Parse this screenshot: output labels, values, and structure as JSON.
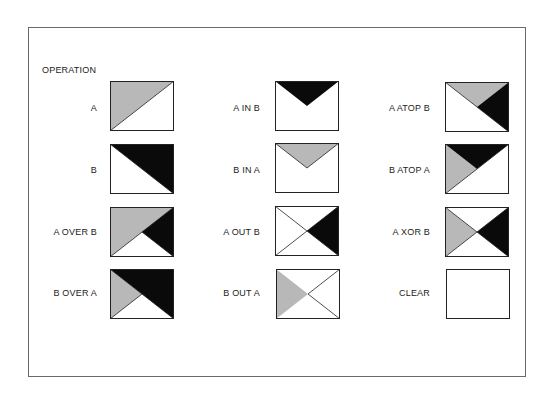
{
  "title": "OPERATION",
  "colors": {
    "A": "#b8b8b8",
    "B": "#0a0a0a",
    "line": "#222222",
    "frame": "#6a6a6a"
  },
  "operations": [
    {
      "label": "A",
      "col": 0,
      "row": 0
    },
    {
      "label": "B",
      "col": 0,
      "row": 1
    },
    {
      "label": "A OVER B",
      "col": 0,
      "row": 2
    },
    {
      "label": "B OVER A",
      "col": 0,
      "row": 3
    },
    {
      "label": "A IN B",
      "col": 1,
      "row": 0
    },
    {
      "label": "B IN A",
      "col": 1,
      "row": 1
    },
    {
      "label": "A OUT B",
      "col": 1,
      "row": 2
    },
    {
      "label": "B OUT A",
      "col": 1,
      "row": 3
    },
    {
      "label": "A ATOP B",
      "col": 2,
      "row": 0
    },
    {
      "label": "B ATOP A",
      "col": 2,
      "row": 1
    },
    {
      "label": "A XOR B",
      "col": 2,
      "row": 2
    },
    {
      "label": "CLEAR",
      "col": 2,
      "row": 3
    }
  ]
}
